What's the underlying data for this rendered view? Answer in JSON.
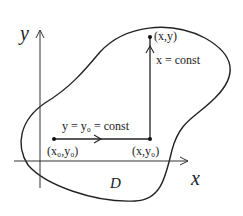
{
  "axes": {
    "x_label": "x",
    "y_label": "y"
  },
  "region_label": "D",
  "points": {
    "start": "(x₀,y₀)",
    "corner": "(x,y₀)",
    "end": "(x,y)"
  },
  "paths": {
    "horizontal": "y = y₀ = const",
    "vertical": "x = const"
  },
  "colors": {
    "stroke": "#222222",
    "background": "#ffffff"
  }
}
